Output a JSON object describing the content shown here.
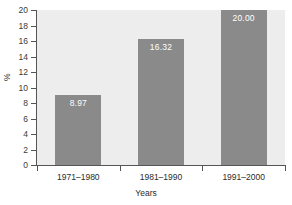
{
  "chart_data": {
    "type": "bar",
    "title": "",
    "subtitle": "",
    "xlabel": "Years",
    "ylabel": "%",
    "categories": [
      "1971–1980",
      "1981–1990",
      "1991–2000"
    ],
    "values": [
      8.97,
      16.32,
      20.0
    ],
    "value_labels": [
      "8.97",
      "16.32",
      "20.00"
    ],
    "ylim": [
      0,
      20
    ],
    "ytick_values": [
      0,
      2,
      4,
      6,
      8,
      10,
      12,
      14,
      16,
      18,
      20
    ],
    "ytick_labels": [
      "0",
      "2",
      "4",
      "6",
      "8",
      "10",
      "12",
      "14",
      "16",
      "18",
      "20"
    ],
    "grid": false,
    "legend": null,
    "legend_position": "none",
    "series": [
      {
        "name": "%",
        "values": [
          8.97,
          16.32,
          20.0
        ]
      }
    ],
    "colors": {
      "bar_fill": "#8a8a8a",
      "plot_background": "#ededed",
      "figure_background": "#ffffff",
      "axis_line": "#555555",
      "tick_text": "#3a3a3a",
      "value_label_text": "#ffffff",
      "category_text": "#2b2b2b"
    }
  }
}
